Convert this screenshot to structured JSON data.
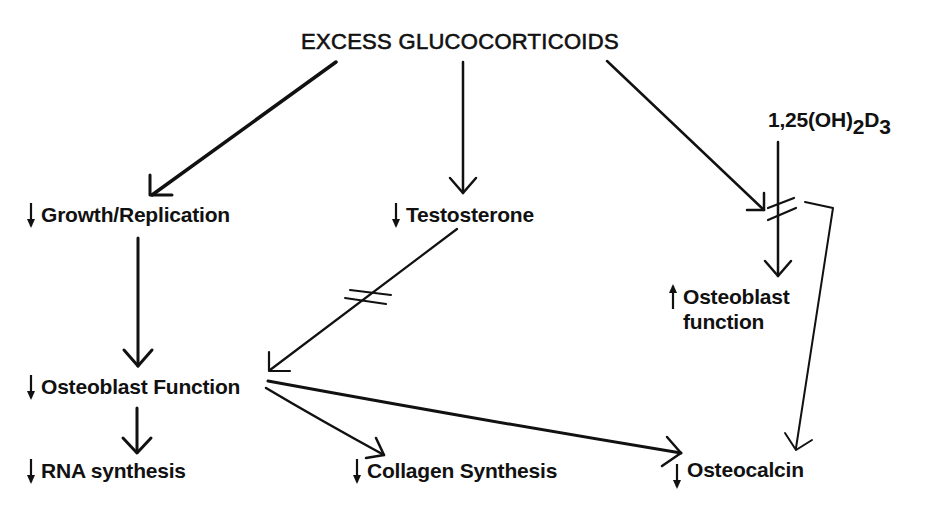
{
  "diagram": {
    "title": "EXCESS GLUCOCORTICOIDS",
    "vitamin_d": {
      "base": "1,25(OH)",
      "sub1": "2",
      "mid": "D",
      "sub2": "3"
    },
    "nodes": {
      "growth": {
        "direction": "down",
        "label": "Growth/Replication"
      },
      "testosterone": {
        "direction": "down",
        "label": "Testosterone"
      },
      "osteoblast_up": {
        "direction": "up",
        "label_line1": "Osteoblast",
        "label_line2": "function"
      },
      "osteoblast_down": {
        "direction": "down",
        "label": "Osteoblast Function"
      },
      "rna": {
        "direction": "down",
        "label": "RNA synthesis"
      },
      "collagen": {
        "direction": "down",
        "label": "Collagen Synthesis"
      },
      "osteocalcin": {
        "direction": "down",
        "label": "Osteocalcin"
      }
    },
    "edges": [
      {
        "from": "EXCESS GLUCOCORTICOIDS",
        "to": "Growth/Replication",
        "type": "stimulates"
      },
      {
        "from": "EXCESS GLUCOCORTICOIDS",
        "to": "Testosterone",
        "type": "stimulates"
      },
      {
        "from": "EXCESS GLUCOCORTICOIDS",
        "to": "1,25(OH)2D3 pathway",
        "type": "blocks"
      },
      {
        "from": "1,25(OH)2D3",
        "to": "Osteoblast function",
        "type": "blocked"
      },
      {
        "from": "1,25(OH)2D3",
        "to": "Osteocalcin",
        "type": "leads to"
      },
      {
        "from": "Growth/Replication",
        "to": "Osteoblast Function",
        "type": "leads to"
      },
      {
        "from": "Testosterone",
        "to": "Osteoblast Function",
        "type": "blocked"
      },
      {
        "from": "Osteoblast Function",
        "to": "RNA synthesis",
        "type": "leads to"
      },
      {
        "from": "Osteoblast Function",
        "to": "Collagen Synthesis",
        "type": "leads to"
      },
      {
        "from": "Osteoblast Function",
        "to": "Osteocalcin",
        "type": "leads to"
      }
    ],
    "colors": {
      "ink": "#111111",
      "background": "#ffffff"
    }
  }
}
